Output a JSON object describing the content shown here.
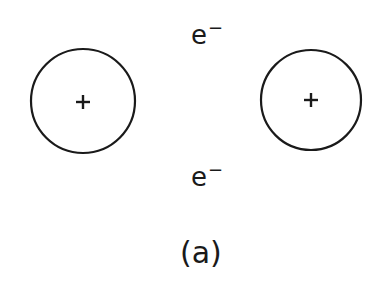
{
  "diagram": {
    "nuclei": [
      {
        "id": "left-nucleus",
        "charge": "+",
        "cx": 83,
        "cy": 101,
        "r": 52
      },
      {
        "id": "right-nucleus",
        "charge": "+",
        "cx": 311,
        "cy": 100,
        "r": 50
      }
    ],
    "electrons": [
      {
        "id": "top-electron",
        "symbol": "e",
        "charge": "−"
      },
      {
        "id": "bottom-electron",
        "symbol": "e",
        "charge": "−"
      }
    ],
    "caption": "(a)",
    "colors": {
      "stroke": "#1a1a1a",
      "background": "#ffffff"
    }
  }
}
